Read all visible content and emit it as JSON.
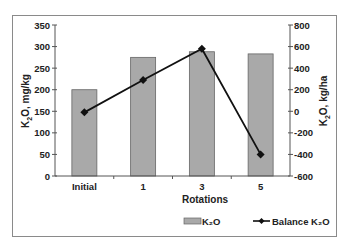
{
  "chart_data": {
    "type": "bar+line",
    "categories": [
      "Initial",
      "1",
      "3",
      "5"
    ],
    "xlabel": "Rotations",
    "series": [
      {
        "name": "K2O",
        "type": "bar",
        "axis": "left",
        "values": [
          200,
          275,
          288,
          283
        ],
        "color": "#a9a9a9"
      },
      {
        "name": "Balance K2O",
        "type": "line",
        "axis": "right",
        "marker": "diamond",
        "values": [
          -10,
          290,
          580,
          -400
        ],
        "color": "#111111"
      }
    ],
    "left_axis": {
      "label": "K2O, mg/kg",
      "ylim": [
        0,
        350
      ],
      "ticks": [
        0,
        50,
        100,
        150,
        200,
        250,
        300,
        350
      ]
    },
    "right_axis": {
      "label": "K2O, kg/ha",
      "ylim": [
        -600,
        800
      ],
      "ticks": [
        -600,
        -400,
        -200,
        0,
        200,
        400,
        600,
        800
      ]
    },
    "grid": false,
    "legend_position": "bottom-right"
  },
  "labels": {
    "left_axis_title_main": "K",
    "left_axis_title_sub": "2",
    "left_axis_title_rest": "O, mg/kg",
    "right_axis_title_main": "K",
    "right_axis_title_sub": "2",
    "right_axis_title_rest": "O, kg/ha",
    "x_axis_title": "Rotations",
    "legend_bar": "K₂O",
    "legend_line": "Balance K₂O"
  }
}
